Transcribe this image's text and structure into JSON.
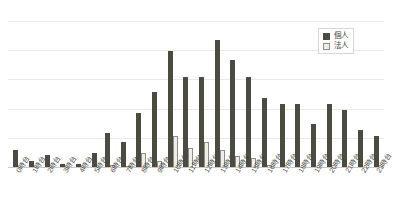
{
  "chart_data": {
    "type": "bar",
    "title": "",
    "subtitle": "",
    "xlabel": "",
    "ylabel": "",
    "grid": true,
    "legend_position": "top-right",
    "ylim": [
      0,
      50
    ],
    "yticks": [
      0,
      10,
      20,
      30,
      40,
      50
    ],
    "categories": [
      "0時台",
      "1時台",
      "2時台",
      "3時台",
      "4時台",
      "5時台",
      "6時台",
      "7時台",
      "8時台",
      "9時台",
      "10時台",
      "11時台",
      "12時台",
      "13時台",
      "14時台",
      "15時台",
      "16時台",
      "17時台",
      "18時台",
      "19時台",
      "20時台",
      "21時台",
      "22時台",
      "23時台"
    ],
    "series": [
      {
        "name": "個人",
        "color": "#4b4b42",
        "values": [
          6,
          2.5,
          4.5,
          1.5,
          1.5,
          5,
          12,
          9,
          19,
          26,
          40,
          31,
          31,
          44,
          37,
          31,
          24,
          22,
          22,
          15,
          22,
          20,
          13,
          11
        ]
      },
      {
        "name": "法人",
        "color": "#efefe9",
        "values": [
          0,
          0,
          0,
          0,
          0,
          0,
          1,
          0.6,
          5,
          2.5,
          11,
          7,
          9,
          6,
          4,
          3.5,
          1,
          0,
          0,
          0,
          0,
          0,
          0,
          0
        ]
      }
    ]
  },
  "legend": {
    "items": [
      {
        "label": "個人"
      },
      {
        "label": "法人"
      }
    ]
  }
}
